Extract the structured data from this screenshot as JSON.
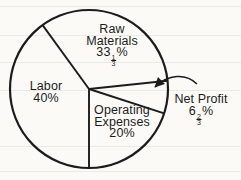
{
  "chart_data": {
    "type": "pie",
    "title": "",
    "legend": "none",
    "style": "black line art on scanned off-white paper, labels inside wedges, external label with arrow for smallest slice",
    "start_angle_deg_compass": 180,
    "direction": "clockwise",
    "segments": [
      {
        "label": "Labor",
        "value": 40,
        "display": "40%"
      },
      {
        "label": "Raw Materials",
        "value": 33.3333,
        "display": "33 1/3%"
      },
      {
        "label": "Net Profit",
        "value": 6.6667,
        "display": "6 2/3%"
      },
      {
        "label": "Operating Expenses",
        "value": 20,
        "display": "20%"
      }
    ]
  },
  "labels": {
    "raw": {
      "line1": "Raw",
      "line2": "Materials",
      "whole": "33",
      "num": "1",
      "den": "3",
      "sym": "%"
    },
    "labor": {
      "line1": "Labor",
      "pct": "40%"
    },
    "opex": {
      "line1": "Operating",
      "line2": "Expenses",
      "pct": "20%"
    },
    "net": {
      "line1": "Net Profit",
      "whole": "6",
      "num": "2",
      "den": "3",
      "sym": "%"
    }
  },
  "colors": {
    "ink": "#1c1c1c",
    "paper": "#fbfaf7"
  }
}
